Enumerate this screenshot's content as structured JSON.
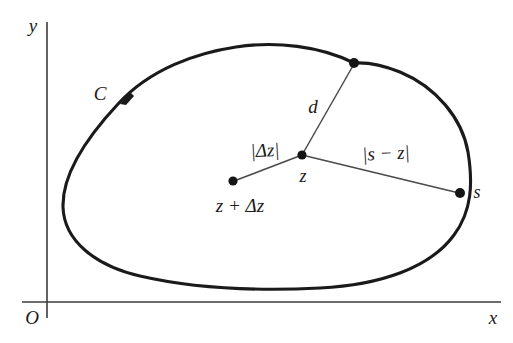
{
  "figure": {
    "colors": {
      "ink": "#1a1a1a",
      "axis": "#3c3c3c",
      "curve": "#1a1a1a",
      "segment": "#4a4a4a",
      "background": "#ffffff"
    },
    "axes": {
      "y_label": "y",
      "x_label": "x",
      "origin_label": "O",
      "origin_px": {
        "x": 47,
        "y": 302
      },
      "y_axis_top_px": {
        "x": 47,
        "y": 22
      },
      "x_axis_right_px": {
        "x": 500,
        "y": 302
      }
    },
    "contour": {
      "label": "C",
      "direction": "counterclockwise",
      "arrow_marker_px": {
        "x": 123,
        "y": 99
      },
      "label_px": {
        "x": 100,
        "y": 93
      }
    },
    "points": [
      {
        "name": "z",
        "label": "z",
        "px": {
          "x": 302,
          "y": 155
        },
        "label_px": {
          "x": 303,
          "y": 176
        },
        "on_curve": false
      },
      {
        "name": "z-plus-dz",
        "label": "z + Δz",
        "px": {
          "x": 233,
          "y": 181
        },
        "label_px": {
          "x": 240,
          "y": 205
        },
        "on_curve": false
      },
      {
        "name": "s",
        "label": "s",
        "px": {
          "x": 460,
          "y": 193
        },
        "label_px": {
          "x": 477,
          "y": 192
        },
        "on_curve": true
      },
      {
        "name": "nearest",
        "label": "",
        "px": {
          "x": 354,
          "y": 63
        },
        "label_px": null,
        "on_curve": true
      }
    ],
    "segments": [
      {
        "name": "d",
        "label": "d",
        "from": "z",
        "to": "nearest",
        "label_px": {
          "x": 313,
          "y": 106
        }
      },
      {
        "name": "delta-z",
        "label": "|Δz|",
        "from": "z",
        "to": "z-plus-dz",
        "label_px": {
          "x": 265,
          "y": 150
        }
      },
      {
        "name": "s-minus-z",
        "label": "|s − z|",
        "from": "z",
        "to": "s",
        "label_px": {
          "x": 386,
          "y": 153
        }
      }
    ]
  }
}
